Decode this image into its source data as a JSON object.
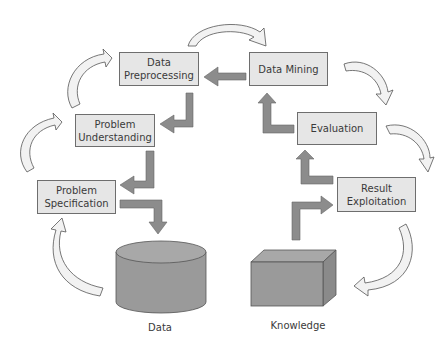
{
  "diagram": {
    "type": "process-cycle",
    "steps": [
      {
        "id": "problem_specification",
        "label": "Problem Specification",
        "line1": "Problem",
        "line2": "Specification"
      },
      {
        "id": "problem_understanding",
        "label": "Problem Understanding",
        "line1": "Problem",
        "line2": "Understanding"
      },
      {
        "id": "data_preprocessing",
        "label": "Data Preprocessing",
        "line1": "Data",
        "line2": "Preprocessing"
      },
      {
        "id": "data_mining",
        "label": "Data Mining",
        "line1": "Data Mining",
        "line2": ""
      },
      {
        "id": "evaluation",
        "label": "Evaluation",
        "line1": "Evaluation",
        "line2": ""
      },
      {
        "id": "result_exploitation",
        "label": "Result Exploitation",
        "line1": "Result",
        "line2": "Exploitation"
      }
    ],
    "stores": {
      "data": {
        "label": "Data",
        "shape": "cylinder"
      },
      "knowledge": {
        "label": "Knowledge",
        "shape": "box"
      }
    },
    "flows": [
      {
        "from": "data_mining",
        "to": "data_preprocessing"
      },
      {
        "from": "data_preprocessing",
        "to": "problem_understanding"
      },
      {
        "from": "problem_understanding",
        "to": "problem_specification"
      },
      {
        "from": "problem_specification",
        "to": "data"
      },
      {
        "from": "knowledge",
        "to": "result_exploitation"
      },
      {
        "from": "evaluation",
        "to": "data_mining"
      },
      {
        "from": "result_exploitation",
        "to": "evaluation"
      }
    ],
    "colors": {
      "box_fill": "#e6e6e6",
      "box_border": "#6e6e6e",
      "flow_arrow": "#8c8c8c",
      "cycle_arrow": "#f2f2f2",
      "store_fill": "#9a9a9a"
    }
  }
}
